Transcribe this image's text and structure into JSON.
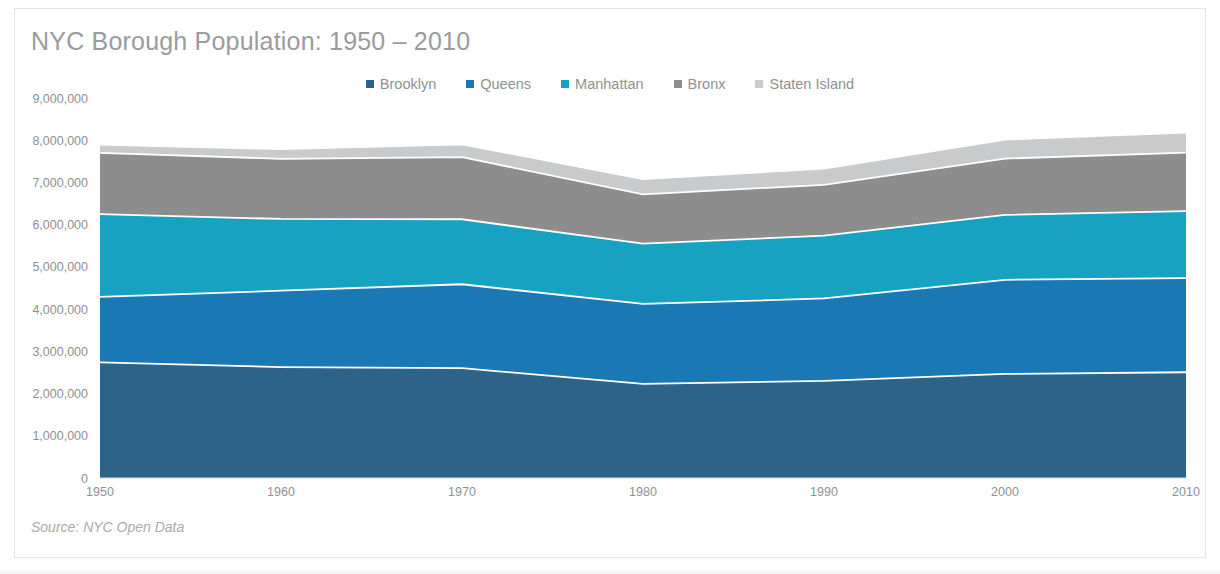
{
  "card": {
    "title": "NYC Borough Population: 1950 – 2010",
    "source_note": "Source: NYC Open Data",
    "frame_color": "#e3e4e5",
    "background": "#ffffff",
    "title_color": "#9a9b9d",
    "axis_text_color": "#8e9092"
  },
  "legend": {
    "position": "top-center",
    "items": [
      {
        "label": "Brooklyn",
        "color": "#2e6389"
      },
      {
        "label": "Queens",
        "color": "#1a78b5"
      },
      {
        "label": "Manhattan",
        "color": "#17a2c2"
      },
      {
        "label": "Bronx",
        "color": "#8d8d8d"
      },
      {
        "label": "Staten Island",
        "color": "#c9cacb"
      }
    ]
  },
  "chart_data": {
    "type": "area",
    "stacked": true,
    "title": "NYC Borough Population: 1950 – 2010",
    "xlabel": "",
    "ylabel": "",
    "x": [
      1950,
      1960,
      1970,
      1980,
      1990,
      2000,
      2010
    ],
    "categories": [
      "1950",
      "1960",
      "1970",
      "1980",
      "1990",
      "2000",
      "2010"
    ],
    "xlim": [
      1950,
      2010
    ],
    "ylim": [
      0,
      9000000
    ],
    "y_ticks": [
      0,
      1000000,
      2000000,
      3000000,
      4000000,
      5000000,
      6000000,
      7000000,
      8000000,
      9000000
    ],
    "y_tick_labels": [
      "0",
      "1,000,000",
      "2,000,000",
      "3,000,000",
      "4,000,000",
      "5,000,000",
      "6,000,000",
      "7,000,000",
      "8,000,000",
      "9,000,000"
    ],
    "x_tick_labels": [
      "1950",
      "1960",
      "1970",
      "1980",
      "1990",
      "2000",
      "2010"
    ],
    "grid": false,
    "legend_position": "top-center",
    "stack_order_bottom_to_top": [
      "Brooklyn",
      "Queens",
      "Manhattan",
      "Bronx",
      "Staten Island"
    ],
    "series": [
      {
        "name": "Brooklyn",
        "color": "#2e6389",
        "values": [
          2738175,
          2627319,
          2602012,
          2230936,
          2300664,
          2465326,
          2504700
        ]
      },
      {
        "name": "Queens",
        "color": "#1a78b5",
        "values": [
          1550849,
          1809578,
          1986473,
          1891325,
          1951598,
          2229379,
          2230722
        ]
      },
      {
        "name": "Manhattan",
        "color": "#17a2c2",
        "values": [
          1960101,
          1698281,
          1539233,
          1428285,
          1487536,
          1537195,
          1585873
        ]
      },
      {
        "name": "Bronx",
        "color": "#8d8d8d",
        "values": [
          1451277,
          1424815,
          1471701,
          1168972,
          1203789,
          1332650,
          1385108
        ]
      },
      {
        "name": "Staten Island",
        "color": "#c9cacb",
        "values": [
          191555,
          221991,
          295443,
          352121,
          378977,
          443728,
          468730
        ]
      }
    ],
    "totals": [
      7891957,
      7781984,
      7894862,
      7071639,
      7322564,
      8008278,
      8175133
    ],
    "separator_stroke": "#ffffff"
  }
}
